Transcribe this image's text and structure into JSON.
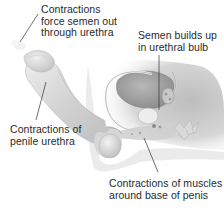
{
  "diagram": {
    "colors": {
      "background": "#ffffff",
      "tissue_light": "#e6e6e6",
      "tissue_mid": "#c9c9c9",
      "tissue_dark": "#9a9a9a",
      "body_shadow": "#d4d4d4",
      "leader_line": "#333333",
      "text": "#2a2a2a"
    },
    "labels": [
      {
        "id": "urethra-force",
        "lines": [
          "Contractions",
          "force semen out",
          "through urethra"
        ]
      },
      {
        "id": "urethral-bulb",
        "lines": [
          "Semen builds up",
          "in urethral bulb"
        ]
      },
      {
        "id": "penile-urethra",
        "lines": [
          "Contractions of",
          "penile urethra"
        ]
      },
      {
        "id": "base-muscles",
        "lines": [
          "Contractions of muscles",
          "around base of penis"
        ]
      }
    ]
  }
}
